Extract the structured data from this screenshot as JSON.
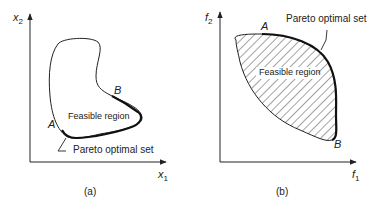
{
  "panels": {
    "a": {
      "caption": "(a)",
      "x_axis": {
        "var": "x",
        "sub": "1"
      },
      "y_axis": {
        "var": "x",
        "sub": "2"
      },
      "region_label": "Feasible region",
      "point_a": "A",
      "point_b": "B",
      "pareto_label": "Pareto optimal set"
    },
    "b": {
      "caption": "(b)",
      "x_axis": {
        "var": "f",
        "sub": "1"
      },
      "y_axis": {
        "var": "f",
        "sub": "2"
      },
      "region_label": "Feasible region",
      "point_a": "A",
      "point_b": "B",
      "pareto_label": "Pareto optimal set"
    }
  },
  "colors": {
    "line": "#222222",
    "background": "#ffffff"
  }
}
